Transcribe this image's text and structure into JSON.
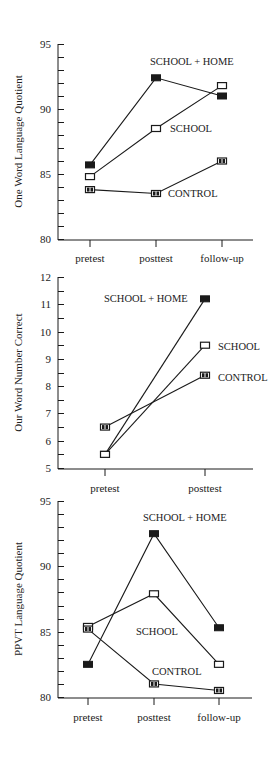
{
  "chart_data": [
    {
      "type": "line",
      "title": "",
      "xlabel": "",
      "ylabel": "One Word Language Quotient",
      "categories": [
        "pretest",
        "posttest",
        "follow-up"
      ],
      "ylim": [
        80,
        95
      ],
      "yticks": [
        80,
        85,
        90,
        95
      ],
      "minor_tick_step": 1,
      "grid": false,
      "legend_position": "inline labels",
      "series": [
        {
          "name": "SCHOOL + HOME",
          "marker": "filled-square",
          "values": [
            85.7,
            92.4,
            91.0
          ]
        },
        {
          "name": "SCHOOL",
          "marker": "open-square",
          "values": [
            84.8,
            88.5,
            91.8
          ]
        },
        {
          "name": "CONTROL",
          "marker": "split-square",
          "values": [
            83.8,
            83.5,
            86.0
          ]
        }
      ],
      "annotations": [
        {
          "text": "SCHOOL + HOME",
          "series": "SCHOOL + HOME"
        },
        {
          "text": "SCHOOL",
          "series": "SCHOOL"
        },
        {
          "text": "CONTROL",
          "series": "CONTROL"
        }
      ]
    },
    {
      "type": "line",
      "title": "",
      "xlabel": "",
      "ylabel": "Our Word Number Correct",
      "categories": [
        "pretest",
        "posttest"
      ],
      "ylim": [
        5,
        12
      ],
      "yticks": [
        5,
        6,
        7,
        8,
        9,
        10,
        11,
        12
      ],
      "minor_tick_step": 0.5,
      "grid": false,
      "legend_position": "inline labels",
      "series": [
        {
          "name": "SCHOOL + HOME",
          "marker": "filled-square",
          "values": [
            5.5,
            11.2
          ]
        },
        {
          "name": "SCHOOL",
          "marker": "open-square",
          "values": [
            5.5,
            9.5
          ]
        },
        {
          "name": "CONTROL",
          "marker": "split-square",
          "values": [
            6.5,
            8.4
          ]
        }
      ],
      "annotations": [
        {
          "text": "SCHOOL + HOME",
          "series": "SCHOOL + HOME"
        },
        {
          "text": "SCHOOL",
          "series": "SCHOOL"
        },
        {
          "text": "CONTROL",
          "series": "CONTROL"
        }
      ]
    },
    {
      "type": "line",
      "title": "",
      "xlabel": "",
      "ylabel": "PPVT Language Quotient",
      "categories": [
        "pretest",
        "posttest",
        "follow-up"
      ],
      "ylim": [
        80,
        95
      ],
      "yticks": [
        80,
        85,
        90,
        95
      ],
      "minor_tick_step": 1,
      "grid": false,
      "legend_position": "inline labels",
      "series": [
        {
          "name": "SCHOOL + HOME",
          "marker": "filled-square",
          "values": [
            82.5,
            92.5,
            85.3
          ]
        },
        {
          "name": "SCHOOL",
          "marker": "open-square",
          "values": [
            85.4,
            87.9,
            82.5
          ]
        },
        {
          "name": "CONTROL",
          "marker": "split-square",
          "values": [
            85.2,
            81.0,
            80.5
          ]
        }
      ],
      "annotations": [
        {
          "text": "SCHOOL + HOME",
          "series": "SCHOOL + HOME"
        },
        {
          "text": "SCHOOL",
          "series": "SCHOOL"
        },
        {
          "text": "CONTROL",
          "series": "CONTROL"
        }
      ]
    }
  ],
  "layout": [
    {
      "plot": {
        "x0": 58,
        "x1": 253,
        "yTop": 44,
        "yBottom": 239
      },
      "xticks_px": [
        90,
        156,
        222
      ],
      "xlabel_y": 262,
      "ylabel_x": 22,
      "labels_px": [
        {
          "x": 150,
          "y": 65
        },
        {
          "x": 170,
          "y": 132
        },
        {
          "x": 168,
          "y": 197
        }
      ]
    },
    {
      "plot": {
        "x0": 58,
        "x1": 253,
        "yTop": 277,
        "yBottom": 468
      },
      "xticks_px": [
        105,
        205
      ],
      "xlabel_y": 492,
      "ylabel_x": 22,
      "labels_px": [
        {
          "x": 104,
          "y": 302
        },
        {
          "x": 218,
          "y": 350
        },
        {
          "x": 218,
          "y": 381
        }
      ]
    },
    {
      "plot": {
        "x0": 58,
        "x1": 252,
        "yTop": 501,
        "yBottom": 697
      },
      "xticks_px": [
        88,
        154,
        219
      ],
      "xlabel_y": 721,
      "ylabel_x": 22,
      "labels_px": [
        {
          "x": 143,
          "y": 521
        },
        {
          "x": 136,
          "y": 635
        },
        {
          "x": 152,
          "y": 675
        }
      ]
    }
  ],
  "colors": {
    "ink": "#1a1a1a",
    "background": "#ffffff"
  }
}
